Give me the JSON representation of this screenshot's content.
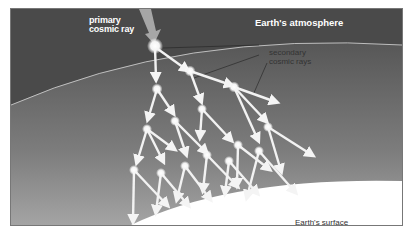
{
  "labels": {
    "primary_ray": "primary\ncosmic ray",
    "primary_line1": "primary",
    "primary_line2": "cosmic ray",
    "atmosphere": "Earth's atmosphere",
    "secondary_line1": "secondary",
    "secondary_line2": "cosmic rays",
    "surface": "Earth's surface"
  },
  "colors": {
    "space": "#4a4a4a",
    "atmosphere_top": "#5a5a5a",
    "atmosphere_bottom": "#9a9a9a",
    "surface": "#ffffff",
    "arrow": "#f2f2f2",
    "primary_arrow": "#a8a8a8",
    "node": "#ffffff"
  }
}
